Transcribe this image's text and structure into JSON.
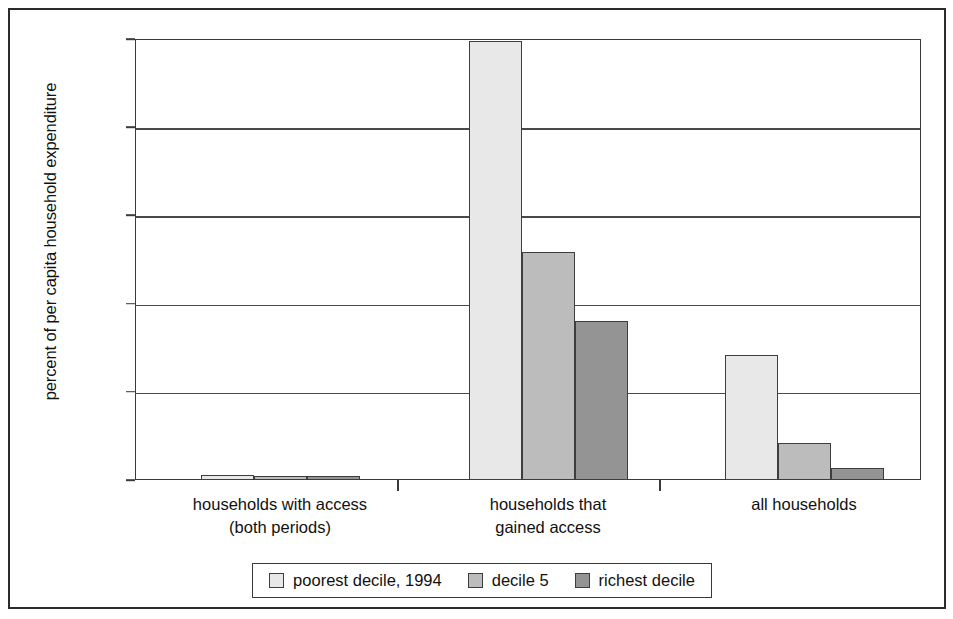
{
  "chart_data": {
    "type": "bar",
    "title": "",
    "xlabel": "",
    "ylabel": "percent of per capita household expenditure",
    "ylim": [
      0,
      25
    ],
    "yticks": [
      0,
      5,
      10,
      15,
      20,
      25
    ],
    "ytick_labels": [
      "0",
      "5",
      "10",
      "15",
      "20",
      "25"
    ],
    "grid": true,
    "legend_position": "bottom",
    "categories": [
      "households with access\n(both periods)",
      "households that\ngained access",
      "all households"
    ],
    "category_lines": [
      [
        "households with access",
        "(both periods)"
      ],
      [
        "households that",
        "gained access"
      ],
      [
        "all households"
      ]
    ],
    "series": [
      {
        "name": "poorest decile, 1994",
        "color": "#e8e8e8",
        "values": [
          0.3,
          24.9,
          7.1
        ]
      },
      {
        "name": "decile 5",
        "color": "#bcbcbc",
        "values": [
          0.25,
          12.9,
          2.1
        ]
      },
      {
        "name": "richest decile",
        "color": "#949494",
        "values": [
          0.2,
          9.0,
          0.7
        ]
      }
    ]
  },
  "legend": {
    "items": [
      {
        "label": "poorest decile, 1994",
        "color": "#e8e8e8"
      },
      {
        "label": "decile 5",
        "color": "#bcbcbc"
      },
      {
        "label": "richest decile",
        "color": "#949494"
      }
    ]
  },
  "colors": {
    "axis": "#3a3a3a",
    "grid": "#4a4a4a",
    "text": "#111111",
    "frame": "#2b2b2b",
    "background": "#ffffff"
  }
}
